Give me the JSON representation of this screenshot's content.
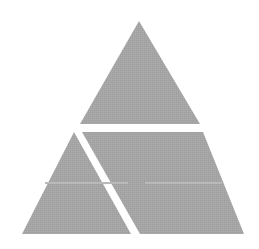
{
  "canvas": {
    "width": 259,
    "height": 249,
    "background_color": "#ffffff"
  },
  "diagram": {
    "type": "geometric-figure",
    "fill_color": "#a3a3a3",
    "gap_color": "#ffffff",
    "faint_line_color": "#b9b9b9",
    "gap_width_px": 6,
    "outer_triangle": {
      "name": "outer-triangle",
      "apex": [
        139,
        21
      ],
      "base_left": [
        22,
        234
      ],
      "base_right": [
        244,
        234
      ]
    },
    "regions": [
      {
        "name": "upper-triangle-region",
        "label": "upper triangle",
        "points": "139,21 200,124 80,124"
      },
      {
        "name": "lower-left-triangle-region",
        "label": "lower left triangle",
        "points": "74,132 131,234 22,234"
      },
      {
        "name": "lower-right-parallelogram-region",
        "label": "lower right parallelogram",
        "points": "82,132 203,132 244,234 140,234"
      }
    ],
    "faint_lines": [
      {
        "name": "faint-horizontal-line-left",
        "x1": 45,
        "y1": 183,
        "x2": 128,
        "y2": 183
      },
      {
        "name": "faint-horizontal-line-right",
        "x1": 145,
        "y1": 183,
        "x2": 222,
        "y2": 183
      }
    ]
  }
}
